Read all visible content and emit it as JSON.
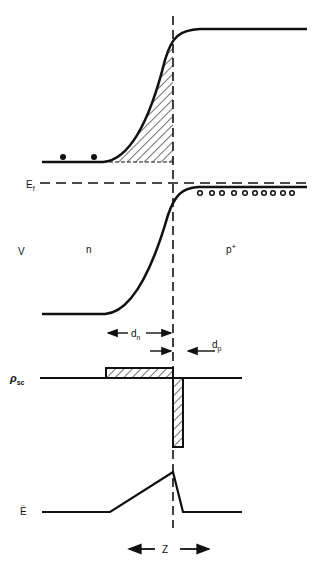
{
  "diagram": {
    "type": "pn-junction-band-diagram",
    "labels": {
      "fermi": "E",
      "fermi_sub": "f",
      "potential": "V",
      "n_region": "n",
      "p_region": "p",
      "p_region_sup": "+",
      "dn": "d",
      "dn_sub": "n",
      "dp": "d",
      "dp_sub": "p",
      "charge": "ρ",
      "charge_sub": "sc",
      "field": "E",
      "field_arrow": "→",
      "width": "Z"
    },
    "electrons_count": 2,
    "holes_count": 11,
    "colors": {
      "ink": "#111111",
      "background": "#ffffff"
    }
  }
}
